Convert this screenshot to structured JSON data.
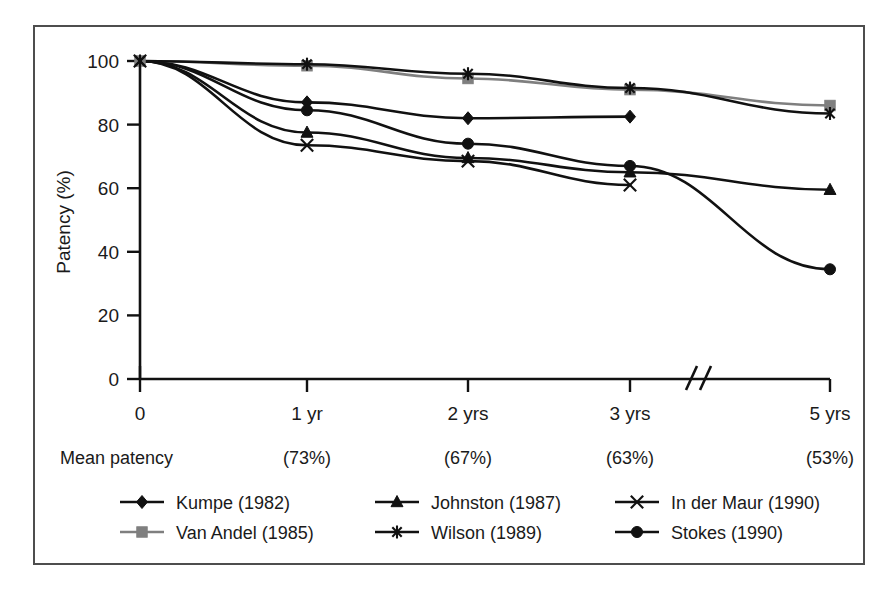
{
  "chart_data": {
    "type": "line",
    "title": "",
    "xlabel": "",
    "ylabel": "Patency (%)",
    "categories": [
      "0",
      "1 yr",
      "2 yrs",
      "3 yrs",
      "5 yrs"
    ],
    "x_tick_labels": [
      "0",
      "1 yr",
      "2 yrs",
      "3 yrs",
      "5 yrs"
    ],
    "y_tick_labels": [
      "0",
      "20",
      "40",
      "60",
      "80",
      "100"
    ],
    "y_ticks": [
      0,
      20,
      40,
      60,
      80,
      100
    ],
    "ylim": [
      0,
      100
    ],
    "grid": false,
    "legend_position": "bottom",
    "axis_break": {
      "present": true,
      "between": [
        "3 yrs",
        "5 yrs"
      ],
      "symbol": "//"
    },
    "annotations_row": {
      "label": "Mean patency",
      "values": [
        "(73%)",
        "(67%)",
        "(63%)",
        "(53%)"
      ],
      "at_categories": [
        "1 yr",
        "2 yrs",
        "3 yrs",
        "5 yrs"
      ]
    },
    "series": [
      {
        "name": "Kumpe (1982)",
        "marker": "diamond",
        "color": "#111111",
        "values": [
          100,
          87,
          82,
          82.5,
          null
        ]
      },
      {
        "name": "Van Andel (1985)",
        "marker": "square",
        "color": "#7f7f7f",
        "values": [
          100,
          98.5,
          94.5,
          91,
          86
        ]
      },
      {
        "name": "Johnston (1987)",
        "marker": "triangle",
        "color": "#111111",
        "values": [
          100,
          77.5,
          69.5,
          65,
          59.5
        ]
      },
      {
        "name": "Wilson (1989)",
        "marker": "asterisk",
        "color": "#111111",
        "values": [
          100,
          99,
          96,
          91.5,
          83.5
        ]
      },
      {
        "name": "In der Maur (1990)",
        "marker": "cross-x",
        "color": "#111111",
        "values": [
          100,
          73.5,
          68.5,
          61,
          null
        ]
      },
      {
        "name": "Stokes (1990)",
        "marker": "circle",
        "color": "#111111",
        "values": [
          100,
          84.5,
          74,
          67,
          34.5
        ]
      }
    ]
  },
  "legend": {
    "entries": [
      {
        "label": "Kumpe (1982)",
        "marker": "diamond",
        "color": "#111111"
      },
      {
        "label": "Johnston (1987)",
        "marker": "triangle",
        "color": "#111111"
      },
      {
        "label": "In der Maur (1990)",
        "marker": "cross-x",
        "color": "#111111"
      },
      {
        "label": "Van Andel (1985)",
        "marker": "square",
        "color": "#7f7f7f"
      },
      {
        "label": "Wilson (1989)",
        "marker": "asterisk",
        "color": "#111111"
      },
      {
        "label": "Stokes (1990)",
        "marker": "circle",
        "color": "#111111"
      }
    ]
  },
  "colors": {
    "frame": "#4d4d4d",
    "axis": "#111111",
    "background": "#ffffff",
    "series_black": "#111111",
    "series_gray": "#7f7f7f"
  }
}
